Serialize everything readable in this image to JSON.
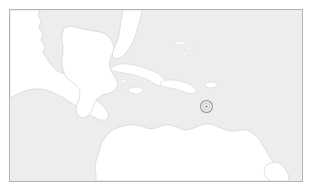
{
  "figure": {
    "kind": "locator-map",
    "title": "Caribbean region locator map",
    "caption": "",
    "region_label": "Caribbean Sea and Central America"
  },
  "frame": {
    "border_color": "#b4b4b4",
    "x": 9,
    "y": 9,
    "width": 294,
    "height": 173
  },
  "colors": {
    "ocean": "#ededed",
    "land": "#ffffff",
    "coastline": "#d2d2d2",
    "frame": "#b4b4b4",
    "marker": "#9a9a9a",
    "page_background": "#ffffff"
  },
  "marker": {
    "name": "location-marker",
    "shape": "ring",
    "label": "",
    "center_x": 206,
    "center_y": 106,
    "outer_radius": 6,
    "inner_radius": 3.4,
    "dot_radius": 1.1,
    "color": "#9a9a9a"
  },
  "landmasses": [
    {
      "name": "north-america-mexico",
      "label": "Mexico and southern North America"
    },
    {
      "name": "florida-peninsula",
      "label": "Florida"
    },
    {
      "name": "yucatan-central-america",
      "label": "Yucatan and Central America"
    },
    {
      "name": "south-america",
      "label": "South America"
    },
    {
      "name": "trinidad-and-guiana-coast",
      "label": "Guiana coast"
    }
  ],
  "islands": [
    {
      "name": "cuba",
      "label": "Cuba"
    },
    {
      "name": "jamaica",
      "label": "Jamaica"
    },
    {
      "name": "hispaniola",
      "label": "Hispaniola"
    },
    {
      "name": "puerto-rico",
      "label": "Puerto Rico"
    },
    {
      "name": "bahamas",
      "label": "Bahamas"
    }
  ]
}
